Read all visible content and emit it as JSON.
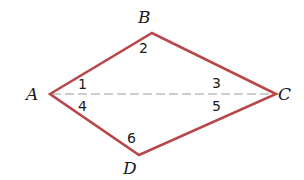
{
  "diagram": {
    "type": "quadrilateral-kite",
    "colors": {
      "edge": "#b8474a",
      "diagonal": "#bdbdbd",
      "text": "#1a1a1a",
      "background": "#ffffff"
    },
    "vertices": {
      "A": {
        "label": "A",
        "x": 50,
        "y": 94
      },
      "B": {
        "label": "B",
        "x": 152,
        "y": 33
      },
      "C": {
        "label": "C",
        "x": 276,
        "y": 94
      },
      "D": {
        "label": "D",
        "x": 139,
        "y": 155
      }
    },
    "edges": [
      "AB",
      "BC",
      "CD",
      "DA"
    ],
    "diagonals": [
      {
        "from": "A",
        "to": "C",
        "style": "dashed"
      }
    ],
    "angles": [
      {
        "label": "1",
        "at": "A",
        "side": "upper"
      },
      {
        "label": "2",
        "at": "B"
      },
      {
        "label": "3",
        "at": "C",
        "side": "upper"
      },
      {
        "label": "4",
        "at": "A",
        "side": "lower"
      },
      {
        "label": "5",
        "at": "C",
        "side": "lower"
      },
      {
        "label": "6",
        "at": "D"
      }
    ]
  }
}
